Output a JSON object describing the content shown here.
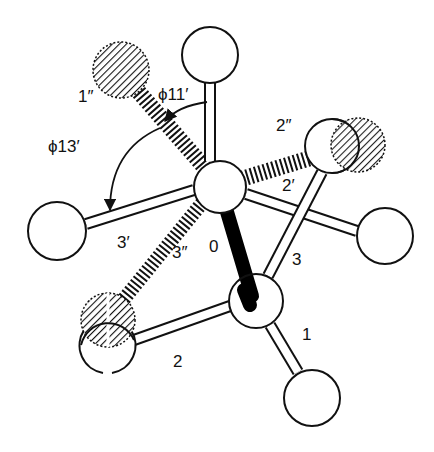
{
  "figure": {
    "labels": {
      "one_double_prime": "1″",
      "phi11": "ϕ11′",
      "phi13": "ϕ13′",
      "two_double_prime": "2″",
      "two_prime": "2′",
      "three_prime": "3′",
      "three_double_prime": "3″",
      "zero": "0",
      "three": "3",
      "one": "1",
      "two": "2"
    },
    "colors": {
      "stroke": "#111111",
      "background": "#ffffff",
      "central_bond": "#000000"
    }
  }
}
